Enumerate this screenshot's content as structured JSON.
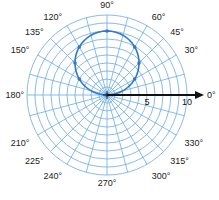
{
  "chart_data": {
    "type": "polar",
    "title": "",
    "equation": "r = 8 sin θ",
    "radial_axis": {
      "min": 0,
      "max": 10,
      "ring_step": 1,
      "tick_labels": [
        "5",
        "10"
      ]
    },
    "angular_axis": {
      "step_deg": 15,
      "tick_labels": [
        "0°",
        "30°",
        "45°",
        "60°",
        "90°",
        "120°",
        "135°",
        "150°",
        "180°",
        "210°",
        "225°",
        "240°",
        "270°",
        "300°",
        "315°",
        "330°"
      ]
    },
    "series": [
      {
        "name": "circle",
        "type": "line",
        "theta_deg": [
          0,
          30,
          45,
          60,
          90,
          120,
          135,
          150,
          180
        ],
        "r": [
          0,
          4,
          5.66,
          6.93,
          8,
          6.93,
          5.66,
          4,
          0
        ],
        "marked_points": true
      }
    ],
    "polar_axis_arrow": {
      "direction": "0°",
      "extends_past": 10
    },
    "grid": true,
    "legend": null
  },
  "colors": {
    "grid": "#7ab3e6",
    "curve": "#2f78c8",
    "axis": "#111111",
    "background": "#ffffff"
  }
}
